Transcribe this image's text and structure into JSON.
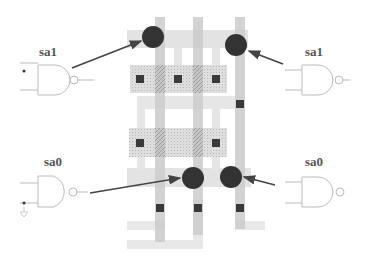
{
  "diagram": {
    "type": "cmos-layout-fault-mapping",
    "labels": {
      "top_left": "sa1",
      "top_right": "sa1",
      "bottom_left": "sa0",
      "bottom_right": "sa0"
    },
    "colors": {
      "poly": "#c8c8c8",
      "metal": "#e6e6e6",
      "diffusion": "#d2d2d2",
      "contact": "#3a3a3a",
      "fault_dot": "#333333",
      "gate_stroke": "#bbbbbb",
      "arrow": "#444444"
    },
    "gates": [
      {
        "id": "nand-top-left",
        "kind": "NAND",
        "fault": "sa1"
      },
      {
        "id": "nand-top-right",
        "kind": "NAND",
        "fault": "sa1"
      },
      {
        "id": "nand-bottom-left",
        "kind": "NAND",
        "fault": "sa0"
      },
      {
        "id": "nand-bottom-right",
        "kind": "NAND",
        "fault": "sa0"
      }
    ],
    "fault_sites": 4
  }
}
